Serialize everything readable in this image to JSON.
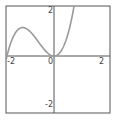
{
  "chart_data": {
    "type": "line",
    "title": "",
    "xlabel": "",
    "ylabel": "",
    "function": "y = x^3 + 2x^2",
    "xlim": [
      -2.04,
      2.38
    ],
    "ylim": [
      -2.38,
      2.08
    ],
    "grid": false,
    "legend": null,
    "x_ticks": [
      {
        "value": -2,
        "label": "-2"
      },
      {
        "value": 0,
        "label": "0"
      },
      {
        "value": 2,
        "label": "2"
      }
    ],
    "y_ticks": [
      {
        "value": 2,
        "label": "2"
      },
      {
        "value": -2,
        "label": "-2"
      }
    ],
    "series": [
      {
        "name": "f(x)",
        "color": "#9a9a9a",
        "x": [
          -2.0,
          -1.8,
          -1.6,
          -1.4,
          -1.333,
          -1.2,
          -1.0,
          -0.8,
          -0.6,
          -0.4,
          -0.2,
          0.0,
          0.2,
          0.4,
          0.6,
          0.8,
          0.84
        ],
        "y": [
          0.0,
          0.648,
          1.024,
          1.176,
          1.185,
          1.152,
          1.0,
          0.768,
          0.504,
          0.256,
          0.072,
          0.0,
          0.088,
          0.384,
          0.936,
          1.792,
          2.04
        ]
      }
    ],
    "annotations": []
  },
  "colors": {
    "frame": "#555555",
    "axes": "#555555",
    "curve": "#9a9a9a",
    "background": "#ffffff",
    "labels": "#444444"
  },
  "layout": {
    "frame": {
      "x": 6,
      "y": 6,
      "w": 104,
      "h": 107
    },
    "origin_px": {
      "x": 54,
      "y": 56
    },
    "px_per_unit_x": 23.5,
    "px_per_unit_y": 24
  }
}
